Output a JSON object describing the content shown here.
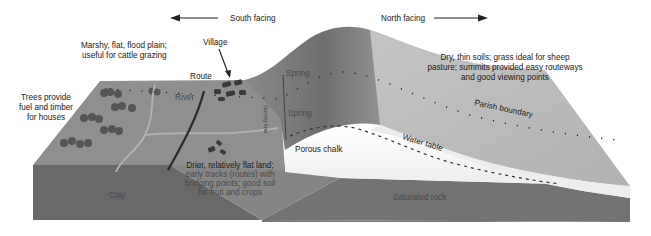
{
  "diagram": {
    "direction_labels": {
      "south": "South facing",
      "north": "North facing"
    },
    "annotations": {
      "marshy": [
        "Marshy, flat, flood plain;",
        "useful for cattle grazing"
      ],
      "village": "Village",
      "route": "Route",
      "river": "River",
      "trees": [
        "Trees provide",
        "fuel and timber",
        "for houses"
      ],
      "spring_top": "Spring",
      "spring_bottom": "Spring",
      "spring_line": "Spring line",
      "dry_soils": [
        "Dry, thin soils; grass ideal for sheep",
        "pasture; summits provided easy routeways",
        "and good viewing points"
      ],
      "parish_boundary": "Parish boundary",
      "water_table": "Water table",
      "porous_chalk": "Porous chalk",
      "drier_land": [
        "Drier, relatively flat land;",
        "early tracks (routes) with",
        "bridging points; good soil",
        "for fruit and crops"
      ],
      "clay": "Clay",
      "saturated_rock": "Saturated rock"
    },
    "colors": {
      "surface_vale": "#8f8f8f",
      "clay_front": "#6a6a6a",
      "saturated_rock": "#737373",
      "chalk_white": "#f2f2f2",
      "scarp_dark": "#707070",
      "dip_slope": "#b8b8b8",
      "text": "#1a1a1a"
    }
  }
}
